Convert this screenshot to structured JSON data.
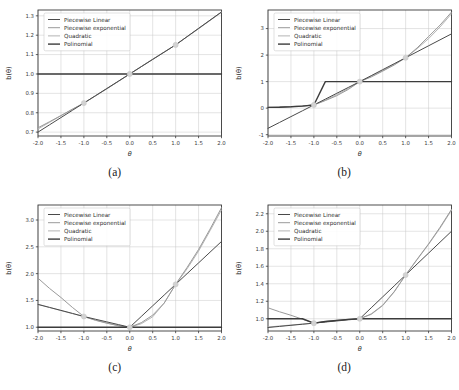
{
  "figure": {
    "type": "multi-panel-line-chart",
    "panels": 4,
    "layout": "2x2",
    "background": "#ffffff",
    "shared_xlabel": "θ",
    "shared_ylabel": "b(θ)",
    "marker_color": "#d2d2d2",
    "grid": true,
    "grid_color": "#c9c9c9"
  },
  "legend": {
    "position": "upper-left",
    "entries": [
      {
        "label": "Piecewise Linear",
        "color": "#4a4a4a",
        "width": 1.0
      },
      {
        "label": "Piecewise exponential",
        "color": "#9a9a9a",
        "width": 1.0
      },
      {
        "label": "Quadratic",
        "color": "#b4b4b4",
        "width": 1.0
      },
      {
        "label": "Polinomial",
        "color": "#3c3c3c",
        "width": 1.4
      }
    ]
  },
  "captions": {
    "a": "(a)",
    "b": "(b)",
    "c": "(c)",
    "d": "(d)"
  },
  "chart_data": [
    {
      "panel": "a",
      "type": "line",
      "title": "",
      "caption": "(a)",
      "xlabel": "θ",
      "ylabel": "b(θ)",
      "xlim": [
        -2.0,
        2.0
      ],
      "ylim": [
        0.68,
        1.33
      ],
      "xticks": [
        -2.0,
        -1.5,
        -1.0,
        -0.5,
        0.0,
        0.5,
        1.0,
        1.5,
        2.0
      ],
      "xticklabels": [
        "-2.0",
        "-1.5",
        "-1.0",
        "-0.5",
        "0.0",
        "0.5",
        "1.0",
        "1.5",
        "2.0"
      ],
      "yticks": [
        0.7,
        0.8,
        0.9,
        1.0,
        1.1,
        1.2,
        1.3
      ],
      "yticklabels": [
        "0.7",
        "0.8",
        "0.9",
        "1.0",
        "1.1",
        "1.2",
        "1.3"
      ],
      "grid": true,
      "legend_position": "upper left",
      "knots": {
        "x": [
          -1.0,
          0.0,
          1.0
        ],
        "y": [
          0.85,
          1.0,
          1.15
        ]
      },
      "x": [
        -2.0,
        -1.75,
        -1.5,
        -1.25,
        -1.0,
        -0.75,
        -0.5,
        -0.25,
        0.0,
        0.25,
        0.5,
        0.75,
        1.0,
        1.25,
        1.5,
        1.75,
        2.0
      ],
      "series": [
        {
          "name": "Piecewise Linear",
          "values": [
            0.7,
            0.7375,
            0.775,
            0.8125,
            0.85,
            0.8875,
            0.925,
            0.9625,
            1.0,
            1.0375,
            1.075,
            1.1125,
            1.15,
            1.1925,
            1.235,
            1.2775,
            1.32
          ]
        },
        {
          "name": "Piecewise exponential",
          "values": [
            0.7225,
            0.7535,
            0.7855,
            0.8185,
            0.85,
            0.8865,
            0.9235,
            0.9615,
            1.0,
            1.0375,
            1.0755,
            1.1125,
            1.15,
            1.1925,
            1.235,
            1.2775,
            1.3195
          ]
        },
        {
          "name": "Quadratic",
          "values": [
            0.716,
            0.7505,
            0.7845,
            0.8175,
            0.85,
            0.8865,
            0.9235,
            0.9615,
            1.0,
            1.0385,
            1.0765,
            1.1135,
            1.15,
            1.1915,
            1.233,
            1.2755,
            1.318
          ]
        },
        {
          "name": "Polinomial",
          "values": [
            1.0,
            1.0,
            1.0,
            1.0,
            1.0,
            1.0,
            1.0,
            1.0,
            1.0,
            1.0,
            1.0,
            1.0,
            1.0,
            1.0,
            1.0,
            1.0,
            1.0
          ]
        }
      ]
    },
    {
      "panel": "b",
      "type": "line",
      "title": "",
      "caption": "(b)",
      "xlabel": "θ",
      "ylabel": "b(θ)",
      "xlim": [
        -2.0,
        2.0
      ],
      "ylim": [
        -1.05,
        3.7
      ],
      "xticks": [
        -2.0,
        -1.5,
        -1.0,
        -0.5,
        0.0,
        0.5,
        1.0,
        1.5,
        2.0
      ],
      "xticklabels": [
        "-2.0",
        "-1.5",
        "-1.0",
        "-0.5",
        "0.0",
        "0.5",
        "1.0",
        "1.5",
        "2.0"
      ],
      "yticks": [
        -1,
        0,
        1,
        2,
        3
      ],
      "yticklabels": [
        "-1",
        "0",
        "1",
        "2",
        "3"
      ],
      "grid": true,
      "legend_position": "upper left",
      "knots": {
        "x": [
          -1.0,
          0.0,
          1.0
        ],
        "y": [
          0.12,
          1.0,
          1.9
        ]
      },
      "x": [
        -2.0,
        -1.75,
        -1.5,
        -1.25,
        -1.0,
        -0.75,
        -0.5,
        -0.25,
        0.0,
        0.25,
        0.5,
        0.75,
        1.0,
        1.25,
        1.5,
        1.75,
        2.0
      ],
      "series": [
        {
          "name": "Piecewise Linear",
          "values": [
            -0.76,
            -0.54,
            -0.32,
            -0.1,
            0.12,
            0.34,
            0.56,
            0.78,
            1.0,
            1.225,
            1.45,
            1.675,
            1.9,
            2.125,
            2.35,
            2.575,
            2.8
          ]
        },
        {
          "name": "Piecewise exponential",
          "values": [
            0.03,
            0.042,
            0.058,
            0.082,
            0.12,
            0.285,
            0.47,
            0.705,
            1.0,
            1.175,
            1.395,
            1.625,
            1.9,
            2.27,
            2.7,
            3.13,
            3.62
          ]
        },
        {
          "name": "Quadratic",
          "values": [
            0.03,
            0.04,
            0.055,
            0.08,
            0.12,
            0.305,
            0.51,
            0.74,
            1.0,
            1.2,
            1.415,
            1.65,
            1.9,
            2.24,
            2.62,
            3.06,
            3.56
          ]
        },
        {
          "name": "Polinomial",
          "values": [
            0.03,
            0.035,
            0.05,
            0.075,
            0.12,
            1.0,
            1.0,
            1.0,
            1.0,
            1.0,
            1.0,
            1.0,
            1.0,
            1.0,
            1.0,
            1.0,
            1.0
          ]
        }
      ]
    },
    {
      "panel": "c",
      "type": "line",
      "title": "",
      "caption": "(c)",
      "xlabel": "θ",
      "ylabel": "b(θ)",
      "xlim": [
        -2.0,
        2.0
      ],
      "ylim": [
        0.93,
        3.28
      ],
      "xticks": [
        -2.0,
        -1.5,
        -1.0,
        -0.5,
        0.0,
        0.5,
        1.0,
        1.5,
        2.0
      ],
      "xticklabels": [
        "-2.0",
        "-1.5",
        "-1.0",
        "-0.5",
        "0.0",
        "0.5",
        "1.0",
        "1.5",
        "2.0"
      ],
      "yticks": [
        1.0,
        1.5,
        2.0,
        2.5,
        3.0
      ],
      "yticklabels": [
        "1.0",
        "1.5",
        "2.0",
        "2.5",
        "3.0"
      ],
      "grid": true,
      "legend_position": "upper left",
      "knots": {
        "x": [
          -1.0,
          0.0,
          1.0
        ],
        "y": [
          1.2,
          1.0,
          1.8
        ]
      },
      "x": [
        -2.0,
        -1.75,
        -1.5,
        -1.25,
        -1.0,
        -0.75,
        -0.5,
        -0.25,
        0.0,
        0.25,
        0.5,
        0.75,
        1.0,
        1.25,
        1.5,
        1.75,
        2.0
      ],
      "series": [
        {
          "name": "Piecewise Linear",
          "values": [
            1.425,
            1.37,
            1.315,
            1.258,
            1.2,
            1.15,
            1.1,
            1.05,
            1.0,
            1.2,
            1.4,
            1.6,
            1.8,
            2.0,
            2.2,
            2.4,
            2.6
          ]
        },
        {
          "name": "Piecewise exponential",
          "values": [
            1.915,
            1.725,
            1.555,
            1.37,
            1.2,
            1.13,
            1.075,
            1.03,
            1.0,
            1.085,
            1.225,
            1.45,
            1.8,
            2.115,
            2.45,
            2.83,
            3.23
          ]
        },
        {
          "name": "Quadratic",
          "values": [
            1.43,
            1.37,
            1.31,
            1.255,
            1.2,
            1.135,
            1.08,
            1.03,
            1.0,
            1.065,
            1.195,
            1.45,
            1.8,
            2.09,
            2.42,
            2.8,
            3.19
          ]
        },
        {
          "name": "Polinomial",
          "values": [
            1.0,
            1.0,
            1.0,
            1.0,
            1.0,
            1.0,
            1.0,
            1.0,
            1.0,
            1.0,
            1.0,
            1.0,
            1.0,
            1.0,
            1.0,
            1.0,
            1.0
          ]
        }
      ]
    },
    {
      "panel": "d",
      "type": "line",
      "title": "",
      "caption": "(d)",
      "xlabel": "θ",
      "ylabel": "b(θ)",
      "xlim": [
        -2.0,
        2.0
      ],
      "ylim": [
        0.86,
        2.3
      ],
      "xticks": [
        -2.0,
        -1.5,
        -1.0,
        -0.5,
        0.0,
        0.5,
        1.0,
        1.5,
        2.0
      ],
      "xticklabels": [
        "-2.0",
        "-1.5",
        "-1.0",
        "-0.5",
        "0.0",
        "0.5",
        "1.0",
        "1.5",
        "2.0"
      ],
      "yticks": [
        1.0,
        1.2,
        1.4,
        1.6,
        1.8,
        2.0,
        2.2
      ],
      "yticklabels": [
        "1.0",
        "1.2",
        "1.4",
        "1.6",
        "1.8",
        "2.0",
        "2.2"
      ],
      "grid": true,
      "legend_position": "upper left",
      "knots": {
        "x": [
          -1.0,
          0.0,
          1.0
        ],
        "y": [
          0.95,
          1.0,
          1.5
        ]
      },
      "x": [
        -2.0,
        -1.75,
        -1.5,
        -1.25,
        -1.0,
        -0.75,
        -0.5,
        -0.25,
        0.0,
        0.25,
        0.5,
        0.75,
        1.0,
        1.25,
        1.5,
        1.75,
        2.0
      ],
      "series": [
        {
          "name": "Piecewise Linear",
          "values": [
            0.9,
            0.9125,
            0.925,
            0.9375,
            0.95,
            0.9625,
            0.975,
            0.9875,
            1.0,
            1.125,
            1.25,
            1.375,
            1.5,
            1.625,
            1.75,
            1.875,
            2.0
          ]
        },
        {
          "name": "Piecewise exponential",
          "values": [
            1.125,
            1.08,
            1.04,
            0.995,
            0.95,
            0.9685,
            0.981,
            0.992,
            1.0,
            1.055,
            1.155,
            1.31,
            1.5,
            1.68,
            1.855,
            2.045,
            2.25
          ]
        },
        {
          "name": "Quadratic",
          "values": [
            0.905,
            0.917,
            0.928,
            0.939,
            0.95,
            0.968,
            0.982,
            0.993,
            1.0,
            1.05,
            1.15,
            1.305,
            1.5,
            1.675,
            1.85,
            2.035,
            2.24
          ]
        },
        {
          "name": "Polinomial",
          "values": [
            1.0,
            1.0,
            1.0,
            1.0,
            0.95,
            0.968,
            0.982,
            0.993,
            1.0,
            1.0,
            1.0,
            1.0,
            1.0,
            1.0,
            1.0,
            1.0,
            1.0
          ]
        }
      ]
    }
  ]
}
